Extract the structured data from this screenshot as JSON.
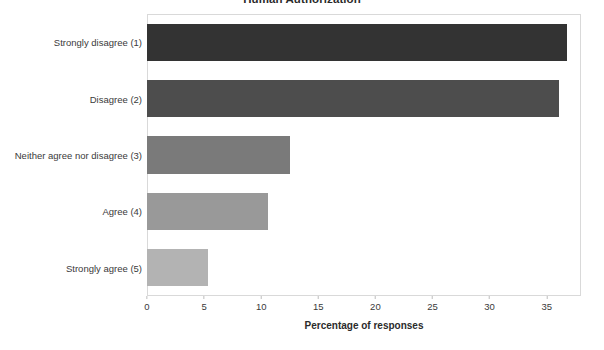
{
  "chart_data": {
    "type": "bar",
    "orientation": "horizontal",
    "title": "Human Authorization",
    "xlabel": "Percentage of responses",
    "ylabel": "",
    "categories": [
      "Strongly disagree (1)",
      "Disagree (2)",
      "Neither agree nor disagree (3)",
      "Agree (4)",
      "Strongly agree (5)"
    ],
    "values": [
      36.8,
      36.1,
      12.5,
      10.6,
      5.3
    ],
    "bar_colors": [
      "#333333",
      "#4d4d4d",
      "#7a7a7a",
      "#999999",
      "#b3b3b3"
    ],
    "xlim": [
      0,
      38
    ],
    "xticks": [
      0,
      5,
      10,
      15,
      20,
      25,
      30,
      35
    ],
    "xtick_labels": [
      "0",
      "5",
      "10",
      "15",
      "20",
      "25",
      "30",
      "35"
    ],
    "grid": false,
    "legend": "none",
    "frame_color": "#d9d9d9"
  }
}
